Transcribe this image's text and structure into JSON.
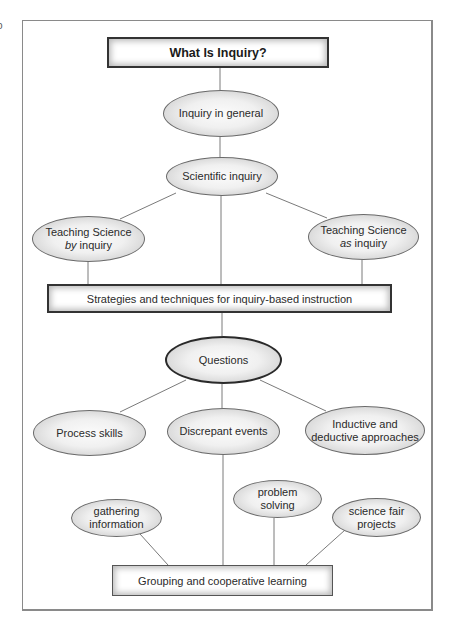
{
  "edge_glyph": "o",
  "title": "What Is Inquiry?",
  "nodes": {
    "inquiry_general": "Inquiry in general",
    "scientific_inquiry": "Scientific inquiry",
    "teaching_by": {
      "line1": "Teaching Science",
      "italic": "by",
      "rest": " inquiry"
    },
    "teaching_as": {
      "line1": "Teaching Science",
      "italic": "as",
      "rest": " inquiry"
    },
    "strategies": "Strategies and techniques for inquiry-based instruction",
    "questions": "Questions",
    "process_skills": "Process skills",
    "discrepant_events": "Discrepant events",
    "inductive": {
      "line1": "Inductive and",
      "line2": "deductive approaches"
    },
    "gathering": {
      "line1": "gathering",
      "line2": "information"
    },
    "problem_solving": {
      "line1": "problem",
      "line2": "solving"
    },
    "science_fair": {
      "line1": "science fair",
      "line2": "projects"
    },
    "grouping": "Grouping and cooperative learning"
  },
  "colors": {
    "border_dark": "#333333",
    "line": "#7a7a7a",
    "frame": "#8a8a8a",
    "fill_center": "#fbfbfb",
    "fill_edge": "#bdbdbd"
  }
}
